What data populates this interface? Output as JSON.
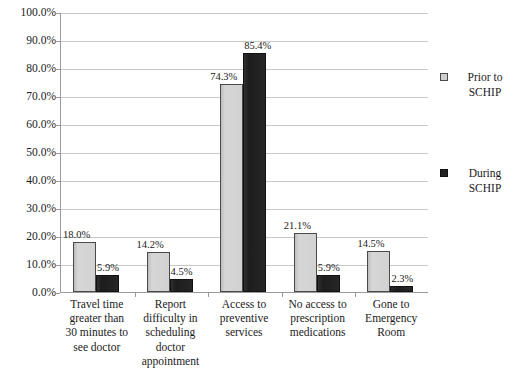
{
  "chart_data": {
    "type": "bar",
    "title": "",
    "xlabel": "",
    "ylabel": "",
    "ylim": [
      0,
      100
    ],
    "ytick_labels": [
      "100.0%",
      "90.0%",
      "80.0%",
      "70.0%",
      "60.0%",
      "50.0%",
      "40.0%",
      "30.0%",
      "20.0%",
      "10.0%",
      "0.0%"
    ],
    "ytick_values": [
      100,
      90,
      80,
      70,
      60,
      50,
      40,
      30,
      20,
      10,
      0
    ],
    "grid": true,
    "legend_position": "right",
    "categories": [
      "Travel time greater than 30 minutes to see doctor",
      "Report difficulty in scheduling doctor appointment",
      "Access to preventive services",
      "No access to prescription medications",
      "Gone to Emergency Room"
    ],
    "category_lines": [
      [
        "Travel time",
        "greater than",
        "30 minutes to",
        "see doctor"
      ],
      [
        "Report",
        "difficulty in",
        "scheduling",
        "doctor",
        "appointment"
      ],
      [
        "Access to",
        "preventive",
        "services"
      ],
      [
        "No access to",
        "prescription",
        "medications"
      ],
      [
        "Gone to",
        "Emergency",
        "Room"
      ]
    ],
    "series": [
      {
        "name": "Prior to SCHIP",
        "name_lines": [
          "Prior to",
          "SCHIP"
        ],
        "color": "#cfcfcf",
        "values": [
          18.0,
          14.2,
          74.3,
          21.1,
          14.5
        ],
        "labels": [
          "18.0%",
          "14.2%",
          "74.3%",
          "21.1%",
          "14.5%"
        ]
      },
      {
        "name": "During SCHIP",
        "name_lines": [
          "During",
          "SCHIP"
        ],
        "color": "#242424",
        "values": [
          5.9,
          4.5,
          85.4,
          5.9,
          2.3
        ],
        "labels": [
          "5.9%",
          "4.5%",
          "85.4%",
          "5.9%",
          "2.3%"
        ]
      }
    ]
  }
}
